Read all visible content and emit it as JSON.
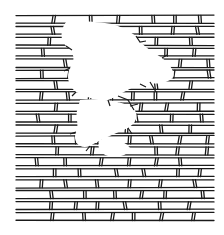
{
  "image": {
    "subject": "brick wall line drawing with crumbled missing section",
    "colors": {
      "ink": "#1a1a1a",
      "background": "#ffffff"
    },
    "wall_bounds": {
      "x": 16,
      "y": 14,
      "width": 198,
      "height": 208
    },
    "row_count": 19
  }
}
